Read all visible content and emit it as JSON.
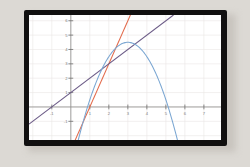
{
  "figure": {
    "frame_color": "#111010",
    "page_background": "#dcd9d4",
    "plot_background": "#ffffff",
    "grid_color": "#e9e6e4",
    "axis_color": "#8e8d8c"
  },
  "chart_data": {
    "type": "line",
    "title": "",
    "subtitle": "",
    "xlabel": "",
    "ylabel": "",
    "xlim": [
      -2.2,
      7.9
    ],
    "ylim": [
      -2.3,
      6.4
    ],
    "grid": true,
    "legend": "none",
    "xticks": [
      -1,
      1,
      2,
      3,
      4,
      5,
      6,
      7
    ],
    "xticklabels": [
      "-1",
      "1",
      "2",
      "3",
      "4",
      "5",
      "6",
      "7"
    ],
    "yticks": [
      -1,
      1,
      2,
      3,
      4,
      5,
      6
    ],
    "yticklabels": [
      "-1",
      "1",
      "2",
      "3",
      "4",
      "5",
      "6"
    ],
    "series": [
      {
        "name": "steep-line",
        "type": "line",
        "color": "#e2694a",
        "equation": "y = 3x - 3",
        "slope": 3,
        "intercept": -3,
        "x": [
          0.22,
          3.45
        ],
        "y": [
          -2.34,
          7.35
        ],
        "points": [
          {
            "x": 1,
            "y": 0
          },
          {
            "x": 2,
            "y": 3
          },
          {
            "x": 3,
            "y": 6
          }
        ]
      },
      {
        "name": "shallow-line",
        "type": "line",
        "color": "#6b5a86",
        "equation": "y = x + 1",
        "slope": 1,
        "intercept": 1,
        "x": [
          -2.2,
          5.4
        ],
        "y": [
          -1.2,
          6.4
        ],
        "points": [
          {
            "x": -1,
            "y": 0
          },
          {
            "x": 0,
            "y": 1
          },
          {
            "x": 2,
            "y": 3
          },
          {
            "x": 4,
            "y": 5
          }
        ]
      },
      {
        "name": "parabola",
        "type": "line",
        "color": "#7aa6d2",
        "equation": "y = -(x - 3)^2 + 4.5",
        "vertex": {
          "x": 3,
          "y": 4.5
        },
        "opens": "down",
        "roots": [
          0.88,
          5.12
        ],
        "points": [
          {
            "x": 1,
            "y": 0.5
          },
          {
            "x": 2,
            "y": 3.5
          },
          {
            "x": 3,
            "y": 4.5
          },
          {
            "x": 4,
            "y": 3.5
          },
          {
            "x": 5,
            "y": 0.5
          },
          {
            "x": 5.6,
            "y": -2.3
          }
        ]
      }
    ],
    "intersections": [
      {
        "x": 2,
        "y": 3,
        "description": "all three curves meet near (2, 3)"
      }
    ]
  }
}
